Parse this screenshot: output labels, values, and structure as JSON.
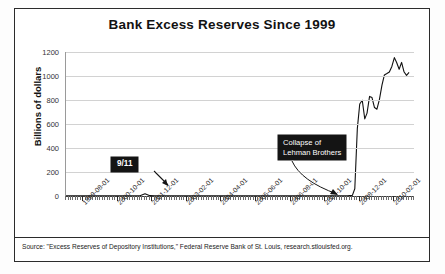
{
  "figure": {
    "title": "Bank Excess Reserves Since 1999",
    "source_note": "Source: \"Excess Reserves of Depository Institutions,\" Federal Reserve Bank of St. Louis, research.stlouisfed.org."
  },
  "annotations": {
    "nine_eleven": "9/11",
    "lehman": "Collapse of\nLehman Brothers"
  },
  "colors": {
    "frame": "#2b2b2b",
    "series": "#111111",
    "grid": "#d2d2d2",
    "callout_bg": "#141414",
    "callout_text": "#ffffff"
  },
  "chart_data": {
    "type": "line",
    "title": "Bank Excess Reserves Since 1999",
    "xlabel": "",
    "ylabel": "Billions of dollars",
    "ylim": [
      0,
      1200
    ],
    "yticks": [
      0,
      200,
      400,
      600,
      800,
      1000,
      1200
    ],
    "grid": true,
    "legend": "none",
    "xticks": [
      "1999-08-01",
      "2000-10-01",
      "2001-12-01",
      "2003-02-01",
      "2004-04-01",
      "2005-06-01",
      "2006-08-01",
      "2007-10-01",
      "2008-12-01",
      "2010-02-01"
    ],
    "xlim": [
      "1999-01-01",
      "2010-10-01"
    ],
    "annotations": [
      {
        "text": "9/11",
        "points_to_x": "2001-09-01",
        "points_to_y": 19
      },
      {
        "text": "Collapse of Lehman Brothers",
        "points_to_x": "2008-09-01",
        "points_to_y": 5
      }
    ],
    "x": [
      "1999-01-01",
      "1999-07-01",
      "2000-01-01",
      "2000-07-01",
      "2001-01-01",
      "2001-07-01",
      "2001-09-01",
      "2001-11-01",
      "2002-01-01",
      "2002-07-01",
      "2003-01-01",
      "2003-07-01",
      "2004-01-01",
      "2004-07-01",
      "2005-01-01",
      "2005-07-01",
      "2006-01-01",
      "2006-07-01",
      "2007-01-01",
      "2007-07-01",
      "2008-01-01",
      "2008-07-01",
      "2008-09-01",
      "2008-10-01",
      "2008-11-01",
      "2008-12-01",
      "2009-01-01",
      "2009-02-01",
      "2009-03-01",
      "2009-04-01",
      "2009-05-01",
      "2009-06-01",
      "2009-07-01",
      "2009-08-01",
      "2009-09-01",
      "2009-10-01",
      "2009-11-01",
      "2009-12-01",
      "2010-01-01",
      "2010-02-01",
      "2010-03-01",
      "2010-04-01",
      "2010-05-01",
      "2010-06-01",
      "2010-07-01",
      "2010-08-01"
    ],
    "y": [
      1,
      1,
      1,
      2,
      1,
      2,
      19,
      3,
      1,
      1,
      1,
      1,
      1,
      1,
      2,
      1,
      2,
      2,
      2,
      2,
      2,
      2,
      5,
      60,
      559,
      767,
      798,
      643,
      691,
      830,
      820,
      737,
      723,
      806,
      924,
      1009,
      1021,
      1034,
      1080,
      1153,
      1112,
      1056,
      1113,
      1033,
      1005,
      1030
    ]
  }
}
